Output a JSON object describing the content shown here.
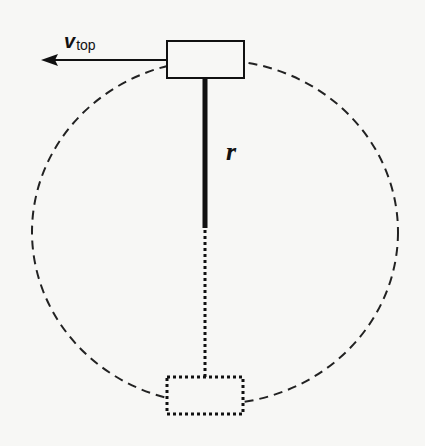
{
  "diagram": {
    "labels": {
      "velocity_symbol": "v",
      "velocity_subscript": "top",
      "radius_symbol": "r"
    },
    "elements": [
      {
        "id": "circular-path",
        "style": "dashed ellipse"
      },
      {
        "id": "mass-top",
        "style": "solid rectangle"
      },
      {
        "id": "mass-bottom",
        "style": "dotted rectangle"
      },
      {
        "id": "rod-solid",
        "style": "thick solid line"
      },
      {
        "id": "rod-dotted",
        "style": "dotted line"
      },
      {
        "id": "velocity-arrow",
        "direction": "left"
      }
    ],
    "colors": {
      "ink": "#111111",
      "background": "#f7f7f5"
    }
  }
}
